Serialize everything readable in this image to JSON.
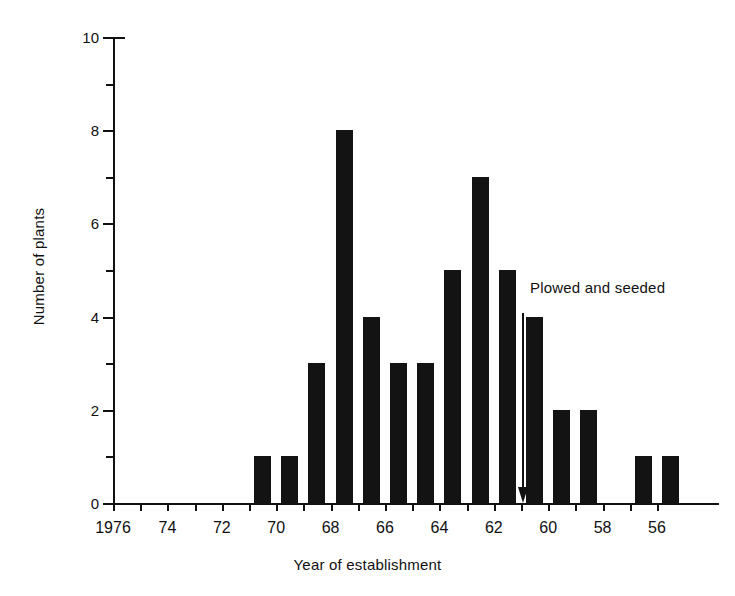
{
  "chart_data": {
    "type": "bar",
    "title": "",
    "xlabel": "Year of establishment",
    "ylabel": "Number of plants",
    "ylim": [
      0,
      10
    ],
    "y_major_ticks": [
      0,
      2,
      4,
      6,
      8,
      10
    ],
    "y_minor_ticks": [
      1,
      3,
      5,
      7,
      9
    ],
    "y_tick_labels": [
      "0",
      "2",
      "4",
      "6",
      "8",
      "10"
    ],
    "x_tick_labels": [
      "1976",
      "74",
      "72",
      "70",
      "68",
      "66",
      "64",
      "62",
      "60",
      "58",
      "56"
    ],
    "x_axis_direction": "decreasing",
    "grid": false,
    "legend": null,
    "categories": [
      1976,
      1975,
      1974,
      1973,
      1972,
      1971,
      1970,
      1969,
      1968,
      1967,
      1966,
      1965,
      1964,
      1963,
      1962,
      1961,
      1960,
      1959,
      1958,
      1957,
      1956
    ],
    "values": [
      0,
      0,
      0,
      0,
      0,
      1,
      1,
      3,
      8,
      4,
      3,
      3,
      5,
      7,
      5,
      4,
      2,
      2,
      0,
      1,
      1
    ],
    "bar_color": "#131313",
    "annotations": [
      {
        "text": "Plowed and seeded",
        "type": "arrow-down",
        "points_to_year": 1961
      }
    ]
  }
}
